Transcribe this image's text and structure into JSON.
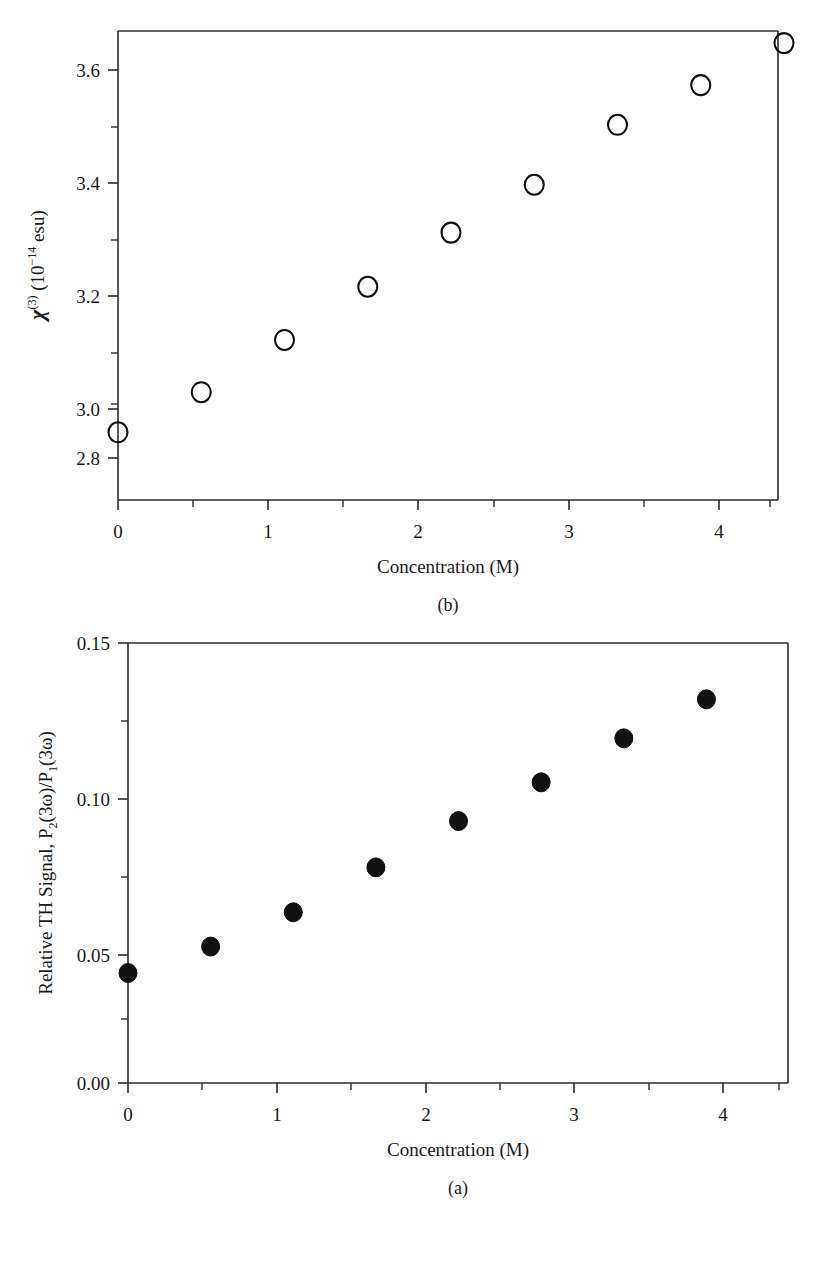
{
  "figure": {
    "panels": [
      {
        "id": "b",
        "caption": "(b)",
        "xlabel": "Concentration (M)",
        "ylabel_parts": {
          "symbol": "χ",
          "symbol_sup": "(3)",
          "units_prefix": " (10",
          "units_exp": "−14",
          "units_suffix": " esu)"
        },
        "ylabel_plain": "χ(3) (10−14 esu)",
        "xticks": [
          "0",
          "1",
          "2",
          "3",
          "4"
        ],
        "yticks": [
          "2.8",
          "3.0",
          "3.2",
          "3.4",
          "3.6"
        ]
      },
      {
        "id": "a",
        "caption": "(a)",
        "xlabel": "Concentration (M)",
        "ylabel_plain": "Relative TH Signal, P₂(3ω)/P₁(3ω)",
        "ylabel_parts": {
          "lead": "Relative TH Signal, P",
          "sub2": "2",
          "mid": "(3ω)/P",
          "sub1": "1",
          "tail": "(3ω)"
        },
        "xticks": [
          "0",
          "1",
          "2",
          "3",
          "4"
        ],
        "yticks": [
          "0.00",
          "0.05",
          "0.10",
          "0.15"
        ]
      }
    ]
  },
  "chart_data": [
    {
      "panel": "b",
      "type": "scatter",
      "title": "",
      "xlabel": "Concentration (M)",
      "ylabel": "χ(3) (10−14 esu)",
      "xlim": [
        0,
        4.5
      ],
      "ylim": [
        2.71,
        3.68
      ],
      "grid": false,
      "legend": "none",
      "marker": "open-circle",
      "marker_color": "#111111",
      "xticks_major": [
        0,
        1,
        2,
        3,
        4
      ],
      "xticks_minor": [
        0.5,
        1.5,
        2.5,
        3.5
      ],
      "yticks_major": [
        2.8,
        3.0,
        3.2,
        3.4,
        3.6
      ],
      "yticks_minor": [
        2.9,
        3.1,
        3.3,
        3.5
      ],
      "x": [
        0.0,
        0.555,
        1.11,
        1.665,
        2.22,
        2.775,
        3.33,
        3.885,
        4.44
      ],
      "y": [
        2.85,
        2.933,
        3.041,
        3.151,
        3.263,
        3.362,
        3.486,
        3.568,
        3.655
      ]
    },
    {
      "panel": "a",
      "type": "scatter",
      "title": "",
      "xlabel": "Concentration (M)",
      "ylabel": "Relative TH Signal, P2(3ω)/P1(3ω)",
      "xlim": [
        0,
        4.5
      ],
      "ylim": [
        0.0,
        0.15
      ],
      "grid": false,
      "legend": "none",
      "marker": "filled-circle",
      "marker_color": "#111111",
      "xticks_major": [
        0,
        1,
        2,
        3,
        4
      ],
      "xticks_minor": [
        0.5,
        1.5,
        2.5,
        3.5
      ],
      "yticks_major": [
        0.0,
        0.05,
        0.1,
        0.15
      ],
      "yticks_minor": [
        0.025,
        0.075,
        0.125
      ],
      "x": [
        0.0,
        0.555,
        1.11,
        1.665,
        2.22,
        2.775,
        3.33,
        3.885
      ],
      "y": [
        0.0375,
        0.0465,
        0.0582,
        0.0735,
        0.0893,
        0.1025,
        0.1175,
        0.1308
      ]
    }
  ]
}
